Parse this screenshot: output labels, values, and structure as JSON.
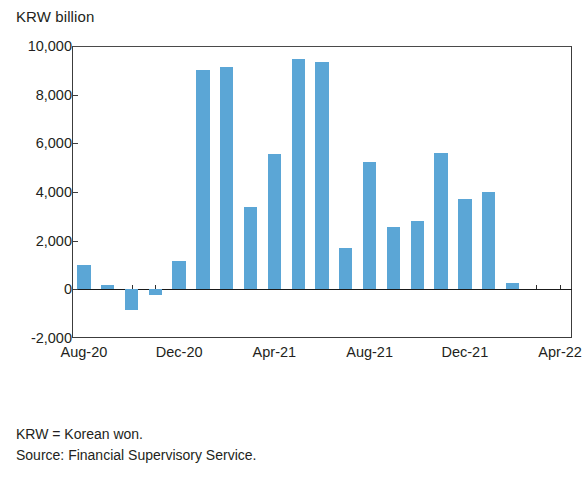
{
  "figure": {
    "unit_label": "KRW billion",
    "footnotes": [
      "KRW = Korean won.",
      "Source: Financial Supervisory Service."
    ]
  },
  "chart_data": {
    "type": "bar",
    "title": "",
    "subtitle": "",
    "xlabel": "",
    "ylabel": "KRW billion",
    "ylim": [
      -2000,
      10000
    ],
    "ytick_labels": [
      "10,000",
      "8,000",
      "6,000",
      "4,000",
      "2,000",
      "0",
      "-2,000"
    ],
    "ytick_values": [
      10000,
      8000,
      6000,
      4000,
      2000,
      0,
      -2000
    ],
    "xtick_labels": [
      "Aug-20",
      "Dec-20",
      "Apr-21",
      "Aug-21",
      "Dec-21",
      "Apr-22"
    ],
    "xtick_categories": [
      "Aug-20",
      "Dec-20",
      "Apr-21",
      "Aug-21",
      "Dec-21",
      "Apr-22"
    ],
    "grid": false,
    "legend": "none",
    "bar_color": "#5ba6d6",
    "axis_color": "#2f2f2f",
    "categories": [
      "Aug-20",
      "Sep-20",
      "Oct-20",
      "Nov-20",
      "Dec-20",
      "Jan-21",
      "Feb-21",
      "Mar-21",
      "Apr-21",
      "May-21",
      "Jun-21",
      "Jul-21",
      "Aug-21",
      "Sep-21",
      "Oct-21",
      "Nov-21",
      "Dec-21",
      "Jan-22",
      "Feb-22",
      "Mar-22",
      "Apr-22"
    ],
    "values": [
      1020,
      180,
      -850,
      -230,
      1180,
      9020,
      9150,
      3400,
      5550,
      9480,
      9350,
      1700,
      5250,
      2550,
      2820,
      5600,
      3720,
      4000,
      250,
      0,
      0
    ],
    "series": [
      {
        "name": "Net issuance",
        "values": [
          1020,
          180,
          -850,
          -230,
          1180,
          9020,
          9150,
          3400,
          5550,
          9480,
          9350,
          1700,
          5250,
          2550,
          2820,
          5600,
          3720,
          4000,
          250,
          0,
          0
        ]
      }
    ]
  }
}
